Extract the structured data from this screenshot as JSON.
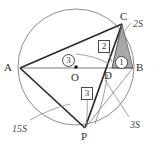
{
  "figure": {
    "type": "circle-geometry-diagram",
    "colors": {
      "stroke_dark": "#2b2b2b",
      "stroke_light": "#8c8c8c",
      "shade_fill": "#a8a8a8",
      "background": "#ffffff",
      "label_text": "#333333"
    },
    "circle": {
      "center_label": "O",
      "center_x": 76,
      "center_y": 67,
      "radius": 58
    },
    "points": [
      {
        "name": "A",
        "label": "A",
        "x": 20,
        "y": 68,
        "label_x": 4,
        "label_y": 62
      },
      {
        "name": "B",
        "label": "B",
        "x": 133,
        "y": 68,
        "label_x": 136,
        "label_y": 62
      },
      {
        "name": "C",
        "label": "C",
        "x": 122,
        "y": 24,
        "label_x": 120,
        "label_y": 11
      },
      {
        "name": "D",
        "label": "D",
        "x": 112,
        "y": 68,
        "label_x": 104,
        "label_y": 70
      },
      {
        "name": "P",
        "label": "P",
        "x": 85,
        "y": 128,
        "label_x": 81,
        "label_y": 131
      },
      {
        "name": "O",
        "label": "O",
        "x": 76,
        "y": 67,
        "label_x": 71,
        "label_y": 72
      }
    ],
    "area_labels": [
      {
        "name": "area-2S",
        "text": "2S",
        "x": 133,
        "y": 19
      },
      {
        "name": "area-3S",
        "text": "3S",
        "x": 130,
        "y": 120
      },
      {
        "name": "area-15S",
        "text": "15S",
        "x": 12,
        "y": 124
      }
    ],
    "ratio_markers": [
      {
        "name": "ratio-circled-1",
        "text": "1",
        "style": "circled",
        "x": 115,
        "y": 56
      },
      {
        "name": "ratio-circled-3",
        "text": "3",
        "style": "circled",
        "x": 62,
        "y": 54
      },
      {
        "name": "ratio-boxed-2",
        "text": "2",
        "style": "boxed",
        "x": 98,
        "y": 40
      },
      {
        "name": "ratio-boxed-3",
        "text": "3",
        "style": "boxed",
        "x": 81,
        "y": 87
      }
    ]
  }
}
